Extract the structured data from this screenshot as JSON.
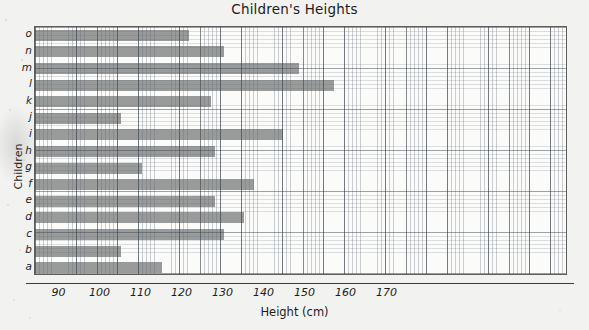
{
  "chart_data": {
    "type": "bar",
    "orientation": "horizontal",
    "title": "Children's Heights",
    "xlabel": "Height (cm)",
    "ylabel": "Children",
    "categories": [
      "a",
      "b",
      "c",
      "d",
      "e",
      "f",
      "g",
      "h",
      "i",
      "j",
      "k",
      "l",
      "m",
      "n",
      "o"
    ],
    "values": [
      115,
      105,
      130,
      135,
      128,
      137.5,
      110,
      128,
      144.5,
      105,
      127,
      157,
      148.5,
      130,
      121.5
    ],
    "xlim": [
      84,
      214
    ],
    "xticks": [
      90,
      100,
      110,
      120,
      130,
      140,
      150,
      160,
      170
    ],
    "xticklabels": [
      "90",
      "100",
      "110",
      "120",
      "130",
      "140",
      "150",
      "160",
      "170"
    ],
    "grid": true,
    "grid_style": "graph-paper",
    "legend": false,
    "bar_color": "#8b8d8c",
    "background_color": "#f2f2f0",
    "plot_background_color": "#fbfbfa",
    "axis_color": "#5d5f5e"
  }
}
